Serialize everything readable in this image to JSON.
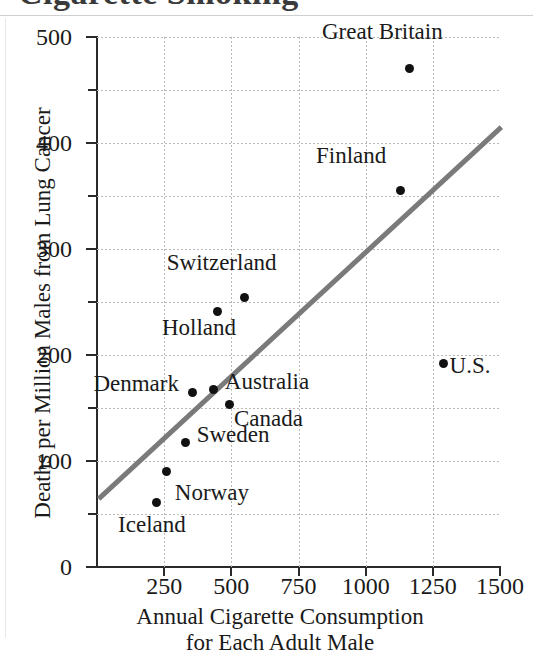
{
  "title": {
    "text": "Cigarette Smoking",
    "cropped": true
  },
  "chart_data": {
    "type": "scatter",
    "title": "Cigarette Smoking",
    "xlabel": "Annual Cigarette Consumption for Each Adult Male",
    "xlabel_line1": "Annual Cigarette Consumption",
    "xlabel_line2": "for Each Adult Male",
    "ylabel": "Deaths per Million Males from Lung Cancer",
    "xlim": [
      0,
      1500
    ],
    "ylim": [
      0,
      500
    ],
    "xticks": [
      0,
      250,
      500,
      750,
      1000,
      1250,
      1500
    ],
    "xtick_labels": [
      "",
      "250",
      "500",
      "750",
      "1000",
      "1250",
      "1500"
    ],
    "yticks": [
      0,
      100,
      200,
      300,
      400,
      500
    ],
    "ytick_labels": [
      "0",
      "100",
      "200",
      "300",
      "400",
      "500"
    ],
    "minor_yticks": [
      50,
      150,
      250,
      350,
      450
    ],
    "grid": true,
    "grid_style": "dotted",
    "legend": false,
    "point_color": "#111111",
    "trendline_color": "#7a7a7a",
    "points": [
      {
        "label": "Iceland",
        "x": 220,
        "y": 61,
        "label_pos": "below-left"
      },
      {
        "label": "Norway",
        "x": 260,
        "y": 90,
        "label_pos": "below-right"
      },
      {
        "label": "Sweden",
        "x": 330,
        "y": 117,
        "label_pos": "right"
      },
      {
        "label": "Denmark",
        "x": 355,
        "y": 165,
        "label_pos": "left"
      },
      {
        "label": "Australia",
        "x": 435,
        "y": 167,
        "label_pos": "right"
      },
      {
        "label": "Canada",
        "x": 495,
        "y": 153,
        "label_pos": "below-right"
      },
      {
        "label": "Holland",
        "x": 450,
        "y": 241,
        "label_pos": "below-left"
      },
      {
        "label": "Switzerland",
        "x": 550,
        "y": 254,
        "label_pos": "above-left"
      },
      {
        "label": "Finland",
        "x": 1128,
        "y": 355,
        "label_pos": "above-left"
      },
      {
        "label": "Great Britain",
        "x": 1165,
        "y": 470,
        "label_pos": "above-left"
      },
      {
        "label": "U.S.",
        "x": 1290,
        "y": 192,
        "label_pos": "below-right"
      }
    ],
    "trendline": {
      "x_start": 0,
      "y_start": 66,
      "x_end": 1500,
      "y_end": 417
    }
  }
}
